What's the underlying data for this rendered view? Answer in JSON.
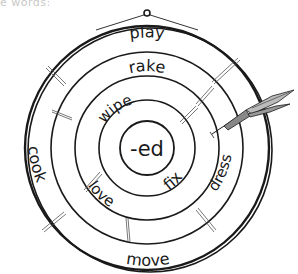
{
  "header": {
    "partial_text": "e words:"
  },
  "dartboard": {
    "center_label": "-ed",
    "rings": {
      "ring1": [
        "wipe",
        "fix"
      ],
      "ring2": [
        "rake",
        "love",
        "dress"
      ],
      "ring3": [
        "play",
        "cook",
        "move"
      ]
    },
    "words": {
      "play": "play",
      "rake": "rake",
      "wipe": "wipe",
      "fix": "fix",
      "love": "love",
      "dress": "dress",
      "cook": "cook",
      "move": "move"
    },
    "ink_color": "#1a1a1a"
  }
}
